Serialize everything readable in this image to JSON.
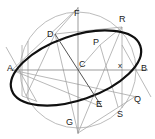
{
  "figure": {
    "width": 155,
    "height": 139,
    "background_color": "#ffffff"
  },
  "colors": {
    "ellipse_stroke": "#101010",
    "circle_stroke": "#b0b0b0",
    "construction_line": "#9a9a9a",
    "axis_line": "#8c8c8c",
    "label_text": "#1a1a1a"
  },
  "labels": [
    {
      "id": "label-F",
      "text": "F",
      "x": 74,
      "y": 13
    },
    {
      "id": "label-R",
      "text": "R",
      "x": 119,
      "y": 19
    },
    {
      "id": "label-D",
      "text": "D",
      "x": 48,
      "y": 36
    },
    {
      "id": "label-P",
      "text": "P",
      "x": 94,
      "y": 41
    },
    {
      "id": "label-A",
      "text": "A",
      "x": 9,
      "y": 66
    },
    {
      "id": "label-C",
      "text": "C",
      "x": 77,
      "y": 61
    },
    {
      "id": "label-x",
      "text": "x",
      "x": 117,
      "y": 62
    },
    {
      "id": "label-B",
      "text": "B",
      "x": 142,
      "y": 66
    },
    {
      "id": "label-Q",
      "text": "Q",
      "x": 133,
      "y": 99
    },
    {
      "id": "label-E",
      "text": "E",
      "x": 95,
      "y": 104
    },
    {
      "id": "label-S",
      "text": "S",
      "x": 117,
      "y": 113
    },
    {
      "id": "label-G",
      "text": "G",
      "x": 66,
      "y": 122
    }
  ],
  "geometry": {
    "center": {
      "name": "C",
      "x": 78,
      "y": 70
    },
    "ellipse": {
      "name": "main-ellipse",
      "center": {
        "x": 76,
        "y": 68
      },
      "semi_major": 68,
      "semi_minor": 32,
      "rotation_deg": -19,
      "stroke_width": 2.1
    },
    "auxiliary_circle": {
      "name": "auxiliary-circle",
      "center": {
        "x": 78,
        "y": 70
      },
      "radius": 58,
      "stroke_width": 0.8
    },
    "axes": [
      {
        "name": "major-axis-AB",
        "from": "A",
        "to": "B",
        "x1": 12,
        "y1": 70,
        "x2": 146,
        "y2": 70
      },
      {
        "name": "minor-axis-FG",
        "from": "F",
        "to": "G",
        "x1": 78,
        "y1": 8,
        "x2": 78,
        "y2": 133
      }
    ],
    "conjugate_diameter": {
      "name": "conjugate-diameter-DE",
      "from": "D",
      "to": "E",
      "x1": 55,
      "y1": 34,
      "x2": 102,
      "y2": 107
    },
    "construction_lines": [
      {
        "name": "line-D-R",
        "x1": 55,
        "y1": 34,
        "x2": 122,
        "y2": 27
      },
      {
        "name": "line-R-x",
        "x1": 122,
        "y1": 27,
        "x2": 122,
        "y2": 70
      },
      {
        "name": "line-R-P",
        "x1": 122,
        "y1": 27,
        "x2": 100,
        "y2": 45
      },
      {
        "name": "line-P-C",
        "x1": 100,
        "y1": 45,
        "x2": 78,
        "y2": 70
      },
      {
        "name": "line-P-S",
        "x1": 100,
        "y1": 45,
        "x2": 116,
        "y2": 106
      },
      {
        "name": "line-x-S",
        "x1": 122,
        "y1": 70,
        "x2": 122,
        "y2": 106
      },
      {
        "name": "line-G-R",
        "x1": 78,
        "y1": 133,
        "x2": 122,
        "y2": 27
      },
      {
        "name": "line-G-D",
        "x1": 78,
        "y1": 133,
        "x2": 55,
        "y2": 34
      },
      {
        "name": "line-A-Q",
        "x1": 12,
        "y1": 70,
        "x2": 136,
        "y2": 96
      },
      {
        "name": "line-A-F",
        "x1": 12,
        "y1": 70,
        "x2": 78,
        "y2": 8
      },
      {
        "name": "tangent-at-A",
        "x1": 6,
        "y1": 48,
        "x2": 36,
        "y2": 101
      },
      {
        "name": "tangent-at-B",
        "x1": 122,
        "y1": 46,
        "x2": 150,
        "y2": 96
      },
      {
        "name": "chord-A-E",
        "x1": 12,
        "y1": 70,
        "x2": 102,
        "y2": 107
      },
      {
        "name": "vertical-helper-left",
        "x1": 28,
        "y1": 42,
        "x2": 28,
        "y2": 99
      },
      {
        "name": "vertical-helper-left2",
        "x1": 22,
        "y1": 46,
        "x2": 22,
        "y2": 95
      },
      {
        "name": "line-D-bottomleft",
        "x1": 55,
        "y1": 34,
        "x2": 26,
        "y2": 95
      },
      {
        "name": "line-F-D",
        "x1": 78,
        "y1": 8,
        "x2": 55,
        "y2": 34
      }
    ],
    "points": [
      {
        "name": "point-A",
        "x": 12,
        "y": 70
      },
      {
        "name": "point-B",
        "x": 146,
        "y": 70
      },
      {
        "name": "point-C",
        "x": 78,
        "y": 70
      },
      {
        "name": "point-D",
        "x": 55,
        "y": 34
      },
      {
        "name": "point-E",
        "x": 102,
        "y": 107
      },
      {
        "name": "point-F",
        "x": 78,
        "y": 8
      },
      {
        "name": "point-G",
        "x": 78,
        "y": 133
      },
      {
        "name": "point-P",
        "x": 100,
        "y": 45
      },
      {
        "name": "point-Q",
        "x": 136,
        "y": 96
      },
      {
        "name": "point-R",
        "x": 122,
        "y": 27
      },
      {
        "name": "point-S",
        "x": 118,
        "y": 107
      },
      {
        "name": "point-x",
        "x": 122,
        "y": 70
      }
    ]
  }
}
